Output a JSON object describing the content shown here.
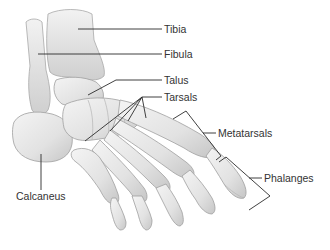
{
  "diagram": {
    "labels": {
      "tibia": "Tibia",
      "fibula": "Fibula",
      "talus": "Talus",
      "tarsals": "Tarsals",
      "metatarsals": "Metatarsals",
      "phalanges": "Phalanges",
      "calcaneus": "Calcaneus"
    },
    "colors": {
      "bone_fill": "#e6e6e6",
      "bone_shade": "#c9c9c9",
      "bone_outline": "#9a9a9a",
      "leader_line": "#2b2b2b",
      "text": "#333333",
      "background": "#ffffff"
    }
  }
}
